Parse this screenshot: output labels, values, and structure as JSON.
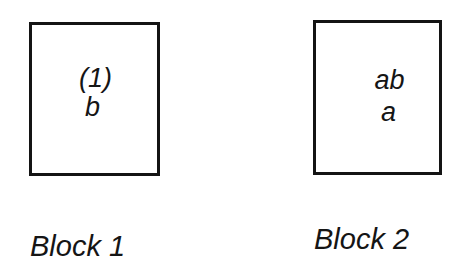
{
  "diagram": {
    "blocks": [
      {
        "label": "Block 1",
        "contents": [
          "(1)",
          "b"
        ]
      },
      {
        "label": "Block 2",
        "contents": [
          "ab",
          "a"
        ]
      }
    ],
    "colors": {
      "border": "#141414",
      "text": "#151515",
      "background": "#ffffff"
    }
  }
}
